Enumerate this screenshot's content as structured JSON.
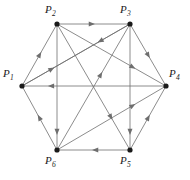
{
  "figure": {
    "type": "directed-graph",
    "background_color": "#ffffff",
    "edge_color": "#6e6e6e",
    "vertex_color": "#1a1a1a",
    "label_color": "#1a1a1a"
  },
  "vertices": [
    {
      "id": "P1",
      "label": "P",
      "subscript": "1",
      "x": 22,
      "y": 86,
      "label_x": 3,
      "label_y": 68
    },
    {
      "id": "P2",
      "label": "P",
      "subscript": "2",
      "x": 57,
      "y": 24,
      "label_x": 45,
      "label_y": 4
    },
    {
      "id": "P3",
      "label": "P",
      "subscript": "3",
      "x": 130,
      "y": 24,
      "label_x": 120,
      "label_y": 4
    },
    {
      "id": "P4",
      "label": "P",
      "subscript": "4",
      "x": 166,
      "y": 86,
      "label_x": 169,
      "label_y": 68
    },
    {
      "id": "P5",
      "label": "P",
      "subscript": "5",
      "x": 130,
      "y": 150,
      "label_x": 120,
      "label_y": 155
    },
    {
      "id": "P6",
      "label": "P",
      "subscript": "6",
      "x": 57,
      "y": 150,
      "label_x": 45,
      "label_y": 155
    }
  ],
  "edges": [
    {
      "from": "P1",
      "to": "P2",
      "kind": "side",
      "arrow_t": 0.55
    },
    {
      "from": "P2",
      "to": "P3",
      "kind": "side",
      "arrow_t": 0.52
    },
    {
      "from": "P3",
      "to": "P4",
      "kind": "side",
      "arrow_t": 0.55
    },
    {
      "from": "P5",
      "to": "P4",
      "kind": "side",
      "arrow_t": 0.55
    },
    {
      "from": "P5",
      "to": "P6",
      "kind": "side",
      "arrow_t": 0.52
    },
    {
      "from": "P6",
      "to": "P1",
      "kind": "side",
      "arrow_t": 0.55
    },
    {
      "from": "P4",
      "to": "P1",
      "kind": "long",
      "arrow_t": 0.82
    },
    {
      "from": "P2",
      "to": "P6",
      "kind": "long",
      "arrow_t": 0.88
    },
    {
      "from": "P3",
      "to": "P5",
      "kind": "long",
      "arrow_t": 0.88
    },
    {
      "from": "P1",
      "to": "P3",
      "kind": "diagonal",
      "arrow_t": 0.3
    },
    {
      "from": "P3",
      "to": "P1",
      "kind": "diagonal",
      "arrow_t": 0.3
    },
    {
      "from": "P2",
      "to": "P4",
      "kind": "diagonal",
      "arrow_t": 0.72
    },
    {
      "from": "P6",
      "to": "P4",
      "kind": "diagonal",
      "arrow_t": 0.72
    },
    {
      "from": "P2",
      "to": "P5",
      "kind": "diagonal",
      "arrow_t": 0.76
    },
    {
      "from": "P6",
      "to": "P3",
      "kind": "diagonal",
      "arrow_t": 0.62
    }
  ]
}
